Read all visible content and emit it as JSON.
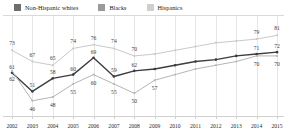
{
  "chart_data": {
    "type": "line",
    "title": "",
    "subtitle": "",
    "xlabel": "",
    "ylabel": "",
    "ylim": [
      40,
      86
    ],
    "grid": true,
    "legend_position": "top-left",
    "categories": [
      "2002",
      "2003",
      "2004",
      "2005",
      "2006",
      "2007",
      "2008",
      "2009",
      "2010",
      "2011",
      "2012",
      "2013",
      "2014",
      "2015"
    ],
    "series": [
      {
        "name": "Non-Hispanic whites",
        "color": "#c9c9c9",
        "values": [
          73,
          67,
          65,
          74,
          76,
          74,
          70,
          71,
          73,
          75,
          77,
          78,
          79,
          81
        ]
      },
      {
        "name": "Blacks",
        "color": "#3d3d3d",
        "values": [
          61,
          51,
          58,
          60,
          69,
          59,
          62,
          63,
          65,
          67,
          68,
          70,
          71,
          72
        ]
      },
      {
        "name": "Hispanics",
        "color": "#b5b5b5",
        "values": [
          62,
          46,
          48,
          55,
          60,
          55,
          50,
          57,
          60,
          63,
          65,
          67,
          70,
          70
        ]
      }
    ],
    "visible_point_labels": {
      "Non-Hispanic whites": [
        "73",
        "67",
        "65",
        "74",
        "76",
        "74",
        "70",
        "",
        "",
        "",
        "",
        "",
        "79",
        "81"
      ],
      "Blacks": [
        "61",
        "51",
        "58",
        "60",
        "69",
        "59",
        "62",
        "",
        "",
        "",
        "",
        "",
        "71",
        "72"
      ],
      "Hispanics": [
        "62",
        "46",
        "48",
        "55",
        "60",
        "55",
        "50",
        "57",
        "",
        "",
        "",
        "",
        "70",
        "70"
      ]
    }
  },
  "legend": {
    "items": [
      {
        "label": "Non-Hispanic whites",
        "color": "#6e6e6e"
      },
      {
        "label": "Blacks",
        "color": "#9a9a9a"
      },
      {
        "label": "Hispanics",
        "color": "#cfcfcf"
      }
    ]
  }
}
